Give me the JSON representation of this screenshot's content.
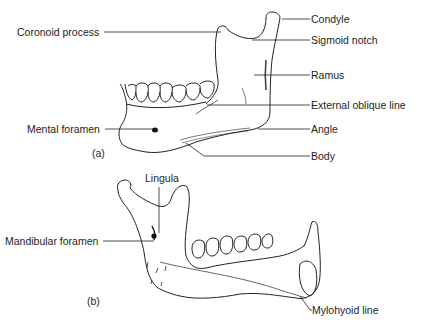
{
  "figure_a": {
    "caption": "(a)",
    "labels": {
      "coronoid_process": "Coronoid process",
      "condyle": "Condyle",
      "sigmoid_notch": "Sigmoid notch",
      "ramus": "Ramus",
      "external_oblique_line": "External oblique line",
      "mental_foramen": "Mental foramen",
      "angle": "Angle",
      "body": "Body"
    }
  },
  "figure_b": {
    "caption": "(b)",
    "labels": {
      "lingula": "Lingula",
      "mandibular_foramen": "Mandibular foramen",
      "mylohyoid_line": "Mylohyoid line"
    }
  },
  "colors": {
    "line": "#1e1e1e",
    "background": "#ffffff"
  }
}
